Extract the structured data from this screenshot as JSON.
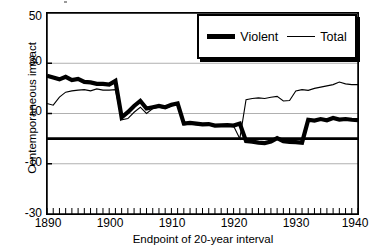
{
  "chart_data": {
    "type": "line",
    "title": "",
    "xlabel": "Endpoint of 20-year interval",
    "ylabel": "Contemporaneous impact",
    "xlim": [
      1890,
      1940
    ],
    "ylim": [
      -30,
      50
    ],
    "yticks": [
      50,
      30,
      10,
      -10,
      -30
    ],
    "xticks": [
      1890,
      1900,
      1910,
      1920,
      1930,
      1940
    ],
    "grid": "horizontal",
    "legend_position": "top-right",
    "zero_line": 0,
    "x": [
      1890,
      1891,
      1892,
      1893,
      1894,
      1895,
      1896,
      1897,
      1898,
      1899,
      1900,
      1901,
      1902,
      1903,
      1904,
      1905,
      1906,
      1907,
      1908,
      1909,
      1910,
      1911,
      1912,
      1913,
      1914,
      1915,
      1916,
      1917,
      1918,
      1919,
      1920,
      1921,
      1922,
      1923,
      1924,
      1925,
      1926,
      1927,
      1928,
      1929,
      1930,
      1931,
      1932,
      1933,
      1934,
      1935,
      1936,
      1937,
      1938,
      1939,
      1940
    ],
    "series": [
      {
        "name": "Violent",
        "style": "thick",
        "color": "#000000",
        "values": [
          25.0,
          24.3,
          23.6,
          24.6,
          23.3,
          23.8,
          22.6,
          22.4,
          21.8,
          21.8,
          21.5,
          23.0,
          8.5,
          10.5,
          13.0,
          15.0,
          12.0,
          12.5,
          13.0,
          12.5,
          13.5,
          14.0,
          6.0,
          6.3,
          6.0,
          5.7,
          5.8,
          5.2,
          5.3,
          5.4,
          5.2,
          6.0,
          -1.0,
          -1.2,
          -1.6,
          -1.8,
          -1.2,
          0.2,
          -1.0,
          -1.3,
          -1.4,
          -1.6,
          7.5,
          7.2,
          7.8,
          7.3,
          8.2,
          7.6,
          7.8,
          7.5,
          7.4
        ]
      },
      {
        "name": "Total",
        "style": "thin",
        "color": "#000000",
        "values": [
          14.0,
          13.3,
          16.5,
          18.5,
          19.0,
          19.3,
          19.5,
          19.0,
          19.8,
          19.3,
          19.3,
          19.5,
          7.5,
          8.0,
          10.5,
          12.5,
          10.0,
          12.0,
          12.5,
          12.0,
          13.0,
          13.5,
          5.5,
          5.8,
          5.5,
          5.3,
          5.4,
          5.0,
          5.1,
          5.2,
          5.0,
          0.0,
          15.5,
          16.0,
          16.2,
          16.0,
          16.5,
          16.8,
          15.0,
          15.2,
          19.0,
          19.5,
          19.2,
          20.0,
          20.5,
          21.0,
          21.5,
          22.5,
          21.8,
          21.5,
          21.5
        ]
      }
    ],
    "legend": [
      {
        "label": "Violent",
        "marker": "thick-line"
      },
      {
        "label": "Total",
        "marker": "thin-line"
      }
    ]
  },
  "axes": {
    "y_tick_labels": [
      "50",
      "30",
      "10",
      "-10",
      "-30"
    ],
    "x_tick_labels": [
      "1890",
      "1900",
      "1910",
      "1920",
      "1930",
      "1940"
    ],
    "y_title": "Contemporaneous impact",
    "x_title": "Endpoint of 20-year interval"
  },
  "colors": {
    "axis": "#000000",
    "grid": "#b0b0b0",
    "plot_background": "#ffffff",
    "series_violent": "#000000",
    "series_total": "#000000"
  }
}
